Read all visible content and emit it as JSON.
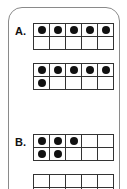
{
  "problems": [
    {
      "label": "A.",
      "frames": [
        {
          "filled": 5,
          "total": 10
        },
        {
          "filled": 6,
          "total": 10
        }
      ]
    },
    {
      "label": "B.",
      "frames": [
        {
          "filled": 5,
          "total": 10,
          "pattern": [
            1,
            1,
            1,
            0,
            0,
            1,
            1,
            0,
            0,
            0
          ]
        },
        {
          "filled": 0,
          "total": 10
        }
      ]
    }
  ],
  "colors": {
    "dot": "#111111",
    "grid": "#333333",
    "panel_border": "#8a8a8a"
  }
}
